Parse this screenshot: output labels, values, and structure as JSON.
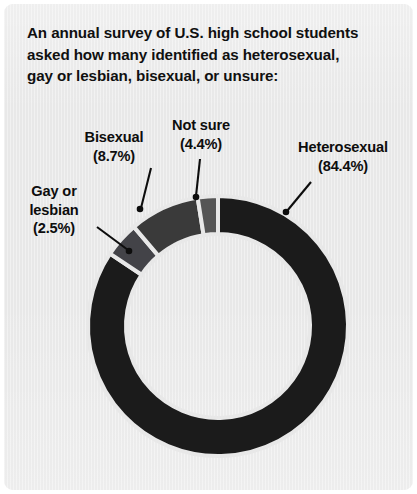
{
  "panel": {
    "background_color": "#e8e8e8",
    "title_lines": [
      "An annual survey of U.S. high school students",
      "asked how many identified as heterosexual,",
      "gay or lesbian, bisexual, or unsure:"
    ]
  },
  "labels": {
    "gay": {
      "name_line1": "Gay or",
      "name_line2": "lesbian",
      "pct": "(2.5%)"
    },
    "bisexual": {
      "name_line1": "Bisexual",
      "pct": "(8.7%)"
    },
    "notsure": {
      "name_line1": "Not sure",
      "pct": "(4.4%)"
    },
    "hetero": {
      "name_line1": "Heterosexual",
      "pct": "(84.4%)"
    }
  },
  "chart_data": {
    "type": "pie",
    "variant": "donut",
    "title": "An annual survey of U.S. high school students asked how many identified as heterosexual, gay or lesbian, bisexual, or unsure:",
    "unit": "percent",
    "total": 100.0,
    "start_angle_deg": 0,
    "direction": "clockwise",
    "center": {
      "x": 214,
      "y": 322
    },
    "outer_radius": 130,
    "inner_radius": 92,
    "separator_color": "#e8e8e8",
    "separator_width": 4,
    "legend": "none",
    "labels_position": "outside-with-leader-lines",
    "categories": [
      "Heterosexual",
      "Not sure",
      "Bisexual",
      "Gay or lesbian"
    ],
    "values": [
      84.4,
      4.4,
      8.7,
      2.5
    ],
    "slices": [
      {
        "label": "Heterosexual",
        "value": 84.4,
        "display": "84.4%",
        "color": "#1b1b1b"
      },
      {
        "label": "Not sure",
        "value": 4.4,
        "display": "4.4%",
        "color": "#434348"
      },
      {
        "label": "Bisexual",
        "value": 8.7,
        "display": "8.7%",
        "color": "#3a3a3a"
      },
      {
        "label": "Gay or lesbian",
        "value": 2.5,
        "display": "2.5%",
        "color": "#555555"
      }
    ]
  }
}
